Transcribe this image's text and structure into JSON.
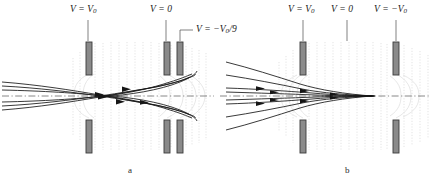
{
  "figure": {
    "type": "electrostatic-lens-diagram",
    "panels": [
      {
        "id": "a",
        "caption": "a",
        "caption_x": 130,
        "caption_y": 168,
        "electrodes": [
          {
            "name": "left-electrode",
            "label": "V = V",
            "subscript": "0",
            "label_x": 70,
            "label_y": 9,
            "leader_x": 88,
            "leader_y1": 20,
            "leader_y2": 41,
            "x": 86,
            "top_y": 42,
            "bottom_y": 120,
            "w": 6,
            "h": 33
          },
          {
            "name": "middle-electrode",
            "label": "V = 0",
            "subscript": "",
            "label_x": 152,
            "label_y": 9,
            "leader_x": 166,
            "leader_y1": 20,
            "leader_y2": 41,
            "x": 164,
            "top_y": 42,
            "bottom_y": 120,
            "w": 6,
            "h": 33
          },
          {
            "name": "right-electrode",
            "label": "V = −V",
            "subscript": "0",
            "suffix": "/9",
            "label_x": 196,
            "label_y": 20,
            "leader_x": 180,
            "leader_y1": 27,
            "leader_y2": 41,
            "x": 177,
            "top_y": 42,
            "bottom_y": 120,
            "w": 6,
            "h": 33
          }
        ],
        "axis": {
          "y": 96,
          "x1": 2,
          "x2": 214
        },
        "trajectory_style": "crossing-focus"
      },
      {
        "id": "b",
        "caption": "b",
        "caption_x": 347,
        "caption_y": 168,
        "electrodes": [
          {
            "name": "left-electrode",
            "label": "V = V",
            "subscript": "0",
            "label_x": 288,
            "label_y": 9,
            "leader_x": 303,
            "leader_y1": 20,
            "leader_y2": 41,
            "x": 300,
            "top_y": 42,
            "bottom_y": 120,
            "w": 6,
            "h": 33
          },
          {
            "name": "middle-electrode",
            "label": "V = 0",
            "subscript": "",
            "label_x": 333,
            "label_y": 9,
            "leader_x": 347,
            "leader_y1": 20,
            "leader_y2": 41,
            "x": 345,
            "top_y": 42,
            "bottom_y": 120,
            "w": 6,
            "h": 33
          },
          {
            "name": "right-electrode",
            "label": "V = −V",
            "subscript": "0",
            "label_x": 376,
            "label_y": 9,
            "leader_x": 396,
            "leader_y1": 20,
            "leader_y2": 41,
            "x": 393,
            "top_y": 42,
            "bottom_y": 120,
            "w": 6,
            "h": 33
          }
        ],
        "axis": {
          "y": 96,
          "x1": 220,
          "x2": 431
        },
        "trajectory_style": "converging-focus"
      }
    ],
    "colors": {
      "electrode_fill": "#8a8a8a",
      "electrode_stroke": "#3a3a3a",
      "equipotential": "#cfcfcf",
      "field_bulge": "#dcdcdc",
      "trajectory": "#1a1a1a",
      "axis": "#6b6b6b",
      "label_text": "#1b1b1b",
      "background": "#ffffff"
    }
  }
}
